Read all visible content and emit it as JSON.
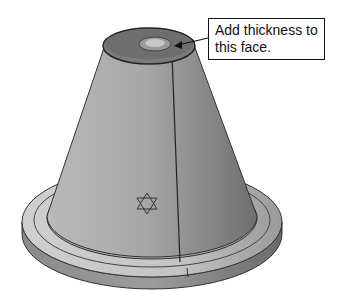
{
  "figure": {
    "callout": {
      "text": "Add thickness to this face."
    }
  }
}
